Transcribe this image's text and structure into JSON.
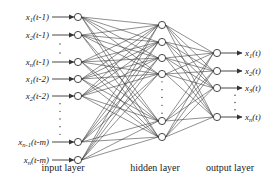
{
  "diagram": {
    "type": "neural-network",
    "layers": [
      {
        "name": "input layer",
        "label": "input layer",
        "x": 78,
        "label_x": 63,
        "nodes": [
          {
            "label": "x1(t-1)",
            "y": 17
          },
          {
            "label": "x2(t-1)",
            "y": 35
          },
          {
            "label": "xn(t-1)",
            "y": 62
          },
          {
            "label": "x1(t-2)",
            "y": 79
          },
          {
            "label": "x2(t-2)",
            "y": 96
          },
          {
            "label": "xn-1(t-m)",
            "y": 142
          },
          {
            "label": "xn(t-m)",
            "y": 160
          }
        ],
        "ellipsis_gaps": [
          [
            35,
            62
          ],
          [
            96,
            142
          ]
        ]
      },
      {
        "name": "hidden layer",
        "label": "hidden layer",
        "x": 162,
        "label_x": 155,
        "nodes": [
          {
            "y": 25
          },
          {
            "y": 42
          },
          {
            "y": 58
          },
          {
            "y": 74
          },
          {
            "y": 121
          },
          {
            "y": 137
          }
        ],
        "ellipsis_gaps": [
          [
            74,
            121
          ]
        ]
      },
      {
        "name": "output layer",
        "label": "output layer",
        "x": 217,
        "label_x": 230,
        "nodes": [
          {
            "label": "x1(t)",
            "y": 53
          },
          {
            "label": "x2(t)",
            "y": 71
          },
          {
            "label": "x3(t)",
            "y": 88
          },
          {
            "label": "xn(t)",
            "y": 117
          }
        ],
        "ellipsis_gaps": [
          [
            88,
            117
          ]
        ]
      }
    ],
    "input_labels": [
      {
        "base": "x",
        "sub": "1",
        "arg": "(t-1)"
      },
      {
        "base": "x",
        "sub": "2",
        "arg": "(t-1)"
      },
      {
        "base": "x",
        "sub": "n",
        "arg": "(t-1)"
      },
      {
        "base": "x",
        "sub": "1",
        "arg": "(t-2)"
      },
      {
        "base": "x",
        "sub": "2",
        "arg": "(t-2)"
      },
      {
        "base": "x",
        "sub": "n-1",
        "arg": "(t-m)"
      },
      {
        "base": "x",
        "sub": "n",
        "arg": "(t-m)"
      }
    ],
    "output_labels": [
      {
        "base": "x",
        "sub": "1",
        "arg": "(t)"
      },
      {
        "base": "x",
        "sub": "2",
        "arg": "(t)"
      },
      {
        "base": "x",
        "sub": "3",
        "arg": "(t)"
      },
      {
        "base": "x",
        "sub": "n",
        "arg": "(t)"
      }
    ],
    "layer_labels": {
      "input": "input layer",
      "hidden": "hidden layer",
      "output": "output layer"
    },
    "colors": {
      "line": "#333333",
      "node_fill": "#ffffff",
      "text": "#222222"
    }
  }
}
